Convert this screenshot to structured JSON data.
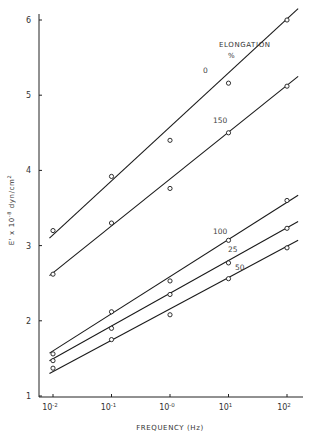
{
  "chart_data": {
    "type": "line",
    "title": "",
    "xlabel": "FREQUENCY (Hz)",
    "ylabel": "E' x 10^-8 dyn/cm^2",
    "xscale": "log",
    "x": [
      0.01,
      0.1,
      1,
      10,
      100
    ],
    "x_tick_labels": [
      {
        "base": "10",
        "exp": "-2"
      },
      {
        "base": "10",
        "exp": "-1"
      },
      {
        "base": "10",
        "exp": "-0"
      },
      {
        "base": "10",
        "exp": "1"
      },
      {
        "base": "10",
        "exp": "2"
      }
    ],
    "y_ticks": [
      1,
      2,
      3,
      4,
      5,
      6
    ],
    "ylim": [
      1,
      6.1
    ],
    "grid": false,
    "legend": {
      "title": "ELONGATION",
      "unit": "%",
      "position": "inline labels near lines"
    },
    "series": [
      {
        "name": "0",
        "label_pos": [
          203,
          73
        ],
        "values": [
          3.2,
          3.92,
          4.4,
          5.16,
          6.0
        ],
        "fit": [
          3.1,
          6.15
        ]
      },
      {
        "name": "150",
        "label_pos": [
          213,
          123
        ],
        "values": [
          2.62,
          3.3,
          3.76,
          4.5,
          5.12
        ],
        "fit": [
          2.6,
          5.25
        ]
      },
      {
        "name": "100",
        "label_pos": [
          213,
          234
        ],
        "values": [
          1.56,
          2.12,
          2.53,
          3.07,
          3.6
        ],
        "fit": [
          1.57,
          3.67
        ]
      },
      {
        "name": "25",
        "label_pos": [
          228,
          252
        ],
        "values": [
          1.47,
          1.9,
          2.35,
          2.77,
          3.23
        ],
        "fit": [
          1.47,
          3.32
        ]
      },
      {
        "name": "50",
        "label_pos": [
          235,
          270
        ],
        "values": [
          1.37,
          1.75,
          2.08,
          2.56,
          2.97
        ],
        "fit": [
          1.3,
          3.07
        ]
      }
    ]
  }
}
